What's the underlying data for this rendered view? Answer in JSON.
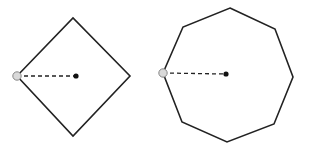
{
  "colors": {
    "background": "#ffffff",
    "stroke": "#222222",
    "center_dot": "#111111",
    "vertex_fill": "#d9d9d9",
    "vertex_stroke": "#888888"
  },
  "shapes": [
    {
      "name": "diamond",
      "type": "square-rotated-45",
      "sides": 4,
      "points": "17,76 73,18 130,76 73,136",
      "center": {
        "x": 76,
        "y": 76
      },
      "marked_vertex": {
        "x": 17,
        "y": 76
      },
      "radius_line": "dashed"
    },
    {
      "name": "octagon",
      "type": "regular-octagon",
      "sides": 8,
      "points": "230,8 275,29 293,77 274,124 227,142 182,122 163,73 183,27",
      "center": {
        "x": 226,
        "y": 74
      },
      "marked_vertex": {
        "x": 163,
        "y": 73
      },
      "radius_line": "dashed"
    }
  ]
}
